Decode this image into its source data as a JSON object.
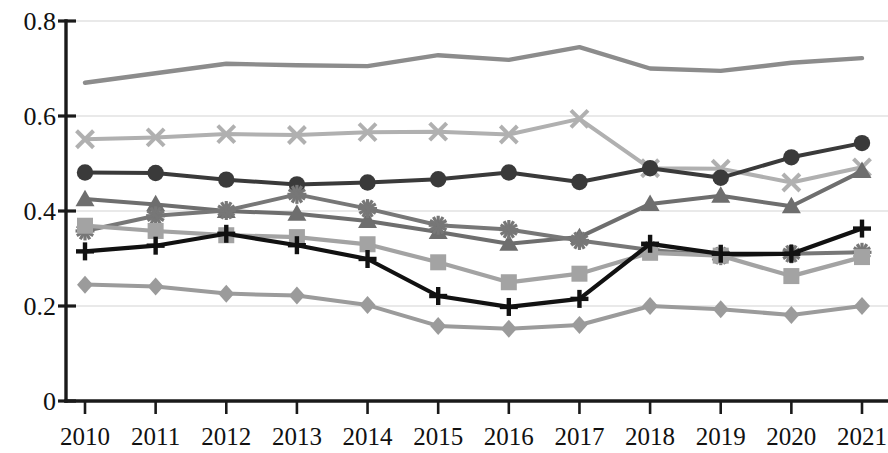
{
  "chart_data": {
    "type": "line",
    "title": "",
    "subtitle": "",
    "xlabel": "",
    "ylabel": "",
    "categories": [
      "2010",
      "2011",
      "2012",
      "2013",
      "2014",
      "2015",
      "2016",
      "2017",
      "2018",
      "2019",
      "2020",
      "2021"
    ],
    "x": [
      2010,
      2011,
      2012,
      2013,
      2014,
      2015,
      2016,
      2017,
      2018,
      2019,
      2020,
      2021
    ],
    "ylim": [
      0,
      0.8
    ],
    "xlim": [
      2010,
      2021
    ],
    "ytick_labels": [
      "0",
      "0.2",
      "0.4",
      "0.6",
      "0.8"
    ],
    "ytick_values": [
      0,
      0.2,
      0.4,
      0.6,
      0.8
    ],
    "grid": "horizontal",
    "legend": "none",
    "annotations": [],
    "series": [
      {
        "name": "series-1-plain-line",
        "marker": "none",
        "color": "#8c8c8c",
        "width": 4.4,
        "values": [
          0.67,
          0.69,
          0.71,
          0.707,
          0.705,
          0.728,
          0.718,
          0.745,
          0.7,
          0.695,
          0.712,
          0.722
        ]
      },
      {
        "name": "series-2-cross",
        "marker": "x",
        "color": "#b0b0b0",
        "width": 4.0,
        "values": [
          0.551,
          0.555,
          0.562,
          0.56,
          0.566,
          0.567,
          0.561,
          0.594,
          0.49,
          0.489,
          0.46,
          0.492
        ]
      },
      {
        "name": "series-3-circle",
        "marker": "circle",
        "color": "#3a3a3a",
        "width": 4.0,
        "values": [
          0.481,
          0.48,
          0.466,
          0.456,
          0.46,
          0.467,
          0.481,
          0.461,
          0.49,
          0.47,
          0.513,
          0.543
        ]
      },
      {
        "name": "series-4-triangle",
        "marker": "triangle",
        "color": "#6e6e6e",
        "width": 4.0,
        "values": [
          0.425,
          0.414,
          0.4,
          0.394,
          0.379,
          0.356,
          0.331,
          0.345,
          0.415,
          0.432,
          0.41,
          0.484
        ]
      },
      {
        "name": "series-5-star",
        "marker": "star",
        "color": "#777777",
        "width": 4.0,
        "values": [
          0.358,
          0.39,
          0.401,
          0.435,
          0.405,
          0.37,
          0.361,
          0.338,
          0.318,
          0.306,
          0.31,
          0.313
        ]
      },
      {
        "name": "series-6-square",
        "marker": "square",
        "color": "#a3a3a3",
        "width": 4.2,
        "values": [
          0.369,
          0.358,
          0.349,
          0.345,
          0.33,
          0.292,
          0.25,
          0.268,
          0.312,
          0.306,
          0.263,
          0.303
        ]
      },
      {
        "name": "series-7-plus",
        "marker": "plus",
        "color": "#111111",
        "width": 4.2,
        "values": [
          0.315,
          0.327,
          0.352,
          0.328,
          0.299,
          0.221,
          0.198,
          0.215,
          0.331,
          0.31,
          0.31,
          0.363
        ]
      },
      {
        "name": "series-8-diamond",
        "marker": "diamond",
        "color": "#9b9b9b",
        "width": 4.0,
        "values": [
          0.245,
          0.241,
          0.226,
          0.222,
          0.202,
          0.158,
          0.152,
          0.16,
          0.2,
          0.193,
          0.181,
          0.2
        ]
      }
    ]
  },
  "axes": {
    "y_label_0": "0",
    "y_label_1": "0.2",
    "y_label_2": "0.4",
    "y_label_3": "0.6",
    "y_label_4": "0.8"
  }
}
